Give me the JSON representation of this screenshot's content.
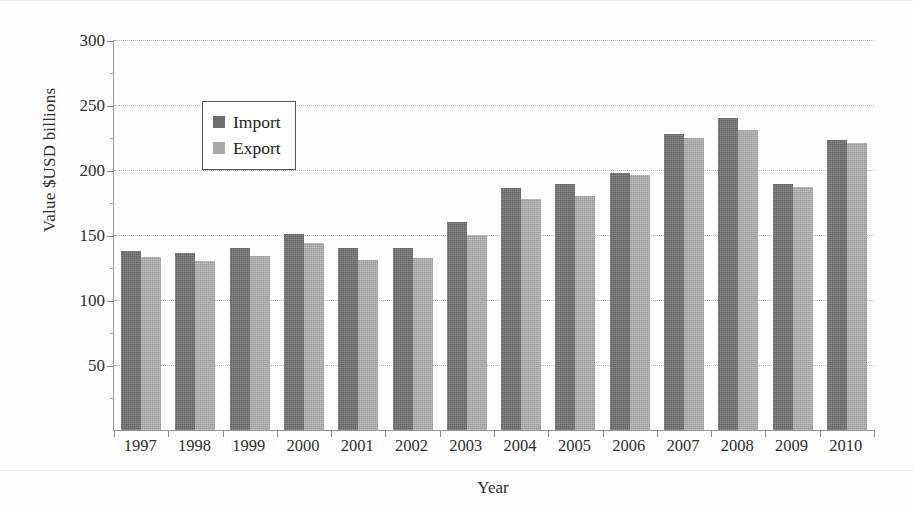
{
  "chart_data": {
    "type": "bar",
    "title": "",
    "xlabel": "Year",
    "ylabel": "Value $USD billions",
    "categories": [
      "1997",
      "1998",
      "1999",
      "2000",
      "2001",
      "2002",
      "2003",
      "2004",
      "2005",
      "2006",
      "2007",
      "2008",
      "2009",
      "2010"
    ],
    "series": [
      {
        "name": "Import",
        "color": "#6e6e6e",
        "values": [
          138,
          136,
          140,
          151,
          140,
          140,
          160,
          186,
          189,
          198,
          228,
          240,
          189,
          223
        ]
      },
      {
        "name": "Export",
        "color": "#a9a9a9",
        "values": [
          133,
          130,
          134,
          144,
          131,
          132,
          150,
          178,
          180,
          196,
          225,
          231,
          187,
          221
        ]
      }
    ],
    "ylim": [
      0,
      300
    ],
    "yticks": [
      50,
      100,
      150,
      200,
      250,
      300
    ],
    "ytick_labels": [
      "50",
      "100",
      "150",
      "200",
      "250",
      "300"
    ],
    "grid": true,
    "legend_position": "upper-left-inside"
  },
  "legend": {
    "items": [
      {
        "label": "Import",
        "swatch": "import-swatch"
      },
      {
        "label": "Export",
        "swatch": "export-swatch"
      }
    ]
  }
}
